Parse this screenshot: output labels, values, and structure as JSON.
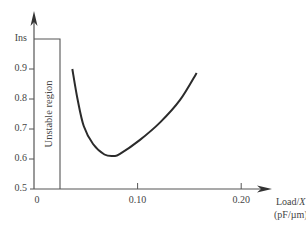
{
  "chart_data": {
    "type": "line",
    "title": "",
    "xlabel": "Load/X",
    "xlabel_var": "X",
    "xlabel_prefix": "Load/",
    "xunit": "(pF/µm)",
    "ylabel": "",
    "xlim": [
      0,
      0.22
    ],
    "ylim": [
      0.5,
      1.0
    ],
    "x_ticks": [
      {
        "value": 0,
        "label": "0"
      },
      {
        "value": 0.1,
        "label": "0.10"
      },
      {
        "value": 0.2,
        "label": "0.20"
      }
    ],
    "y_ticks": [
      {
        "value": 0.5,
        "label": "0.5"
      },
      {
        "value": 0.6,
        "label": "0.6"
      },
      {
        "value": 0.7,
        "label": "0.7"
      },
      {
        "value": 0.8,
        "label": "0.8"
      },
      {
        "value": 0.9,
        "label": "0.9"
      },
      {
        "value": 1.0,
        "label": "Ins"
      }
    ],
    "grid": false,
    "legend": "none",
    "annotations": [
      {
        "type": "region",
        "label": "Unstable region",
        "x_range": [
          0,
          0.025
        ],
        "y_range": [
          0.5,
          1.0
        ]
      }
    ],
    "series": [
      {
        "name": "curve",
        "x": [
          0.037,
          0.042,
          0.048,
          0.057,
          0.068,
          0.077,
          0.083,
          0.102,
          0.122,
          0.141,
          0.157
        ],
        "y": [
          0.9,
          0.8,
          0.71,
          0.65,
          0.615,
          0.61,
          0.617,
          0.663,
          0.723,
          0.797,
          0.887
        ]
      }
    ]
  }
}
